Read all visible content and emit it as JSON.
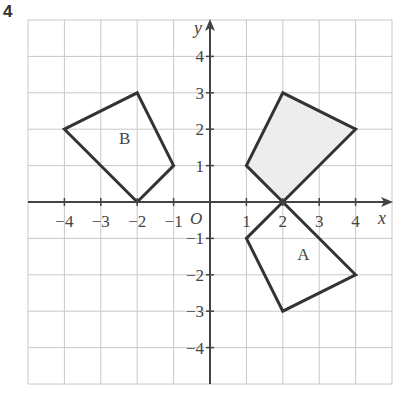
{
  "question_number": "4",
  "chart_data": {
    "type": "diagram",
    "title": "",
    "xlabel": "x",
    "ylabel": "y",
    "origin_label": "O",
    "grid": true,
    "xlim": [
      -5,
      5
    ],
    "ylim": [
      -5,
      5
    ],
    "x_tick_labels": [
      "−4",
      "−3",
      "−2",
      "−1",
      "1",
      "2",
      "3",
      "4"
    ],
    "y_tick_labels": [
      "4",
      "3",
      "2",
      "1",
      "−1",
      "−2",
      "−3",
      "−4"
    ],
    "shapes": [
      {
        "name": "shaded",
        "label": "",
        "fill": "#ededed",
        "vertices": [
          [
            1,
            1
          ],
          [
            2,
            3
          ],
          [
            4,
            2
          ],
          [
            2,
            0
          ]
        ]
      },
      {
        "name": "A",
        "label": "A",
        "fill": "none",
        "vertices": [
          [
            2,
            0
          ],
          [
            4,
            -2
          ],
          [
            2,
            -3
          ],
          [
            1,
            -1
          ]
        ],
        "label_pos": [
          2.4,
          -1.6
        ]
      },
      {
        "name": "B",
        "label": "B",
        "fill": "none",
        "vertices": [
          [
            -4,
            2
          ],
          [
            -2,
            3
          ],
          [
            -1,
            1
          ],
          [
            -2,
            0
          ]
        ],
        "label_pos": [
          -2.5,
          1.6
        ]
      }
    ]
  },
  "colors": {
    "grid": "#c8c8c8",
    "axis": "#444444",
    "shape": "#333333",
    "shaded_fill": "#ededed"
  }
}
